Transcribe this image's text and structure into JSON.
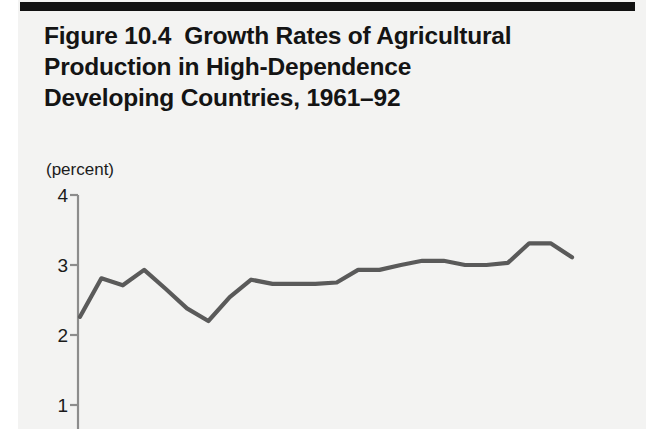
{
  "figure": {
    "title_lines": [
      "Figure 10.4  Growth Rates of Agricultural",
      "Production in High-Dependence",
      "Developing Countries, 1961–92"
    ],
    "title_full": "Figure 10.4  Growth Rates of Agricultural Production in High-Dependence Developing Countries, 1961–92",
    "unit_label": "(percent)",
    "line_color": "#5a5a5a",
    "axis_color": "#8c8c8c",
    "rule_color": "#111111",
    "paper_color": "#f3f3f2"
  },
  "chart_data": {
    "type": "line",
    "title": "Figure 10.4  Growth Rates of Agricultural Production in High-Dependence Developing Countries, 1961–92",
    "xlabel": "",
    "ylabel": "(percent)",
    "ylim": [
      1,
      4
    ],
    "yticks": [
      4,
      3,
      2,
      1
    ],
    "ytick_labels": [
      "4",
      "3",
      "2",
      "1"
    ],
    "grid": false,
    "legend": null,
    "note": "Bottom of figure is cropped; no x-axis tick labels are visible in the image.",
    "series": [
      {
        "name": "Growth rate of agricultural production",
        "color": "#5a5a5a",
        "x": [
          0,
          1,
          2,
          3,
          4,
          5,
          6,
          7,
          8,
          9,
          10,
          11,
          12,
          13,
          14,
          15,
          16,
          17,
          18,
          19,
          20,
          21,
          22,
          23
        ],
        "values": [
          2.26,
          2.81,
          2.71,
          2.93,
          2.66,
          2.38,
          2.2,
          2.54,
          2.79,
          2.73,
          2.73,
          2.73,
          2.75,
          2.93,
          2.93,
          3.0,
          3.06,
          3.06,
          3.0,
          3.0,
          3.03,
          3.31,
          3.31,
          3.11
        ]
      }
    ]
  }
}
